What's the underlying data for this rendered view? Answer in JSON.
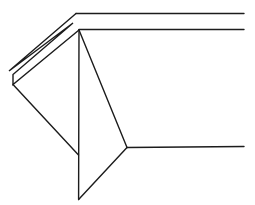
{
  "diagram": {
    "kind": "origami-fold-line-art",
    "background_color": "#ffffff",
    "stroke_color": "#1c1c1c",
    "stroke_width": 1.4,
    "width": 255,
    "height": 205,
    "paths": [
      {
        "name": "top-edge-line",
        "points": [
          [
            76,
            13.5
          ],
          [
            244,
            13.5
          ]
        ]
      },
      {
        "name": "pleat-fold-outline",
        "points": [
          [
            76,
            13.5
          ],
          [
            9,
            71
          ],
          [
            73,
            23
          ],
          [
            13,
            74.5
          ],
          [
            13,
            84.5
          ],
          [
            79,
            30
          ]
        ]
      },
      {
        "name": "upper-horizontal-line",
        "points": [
          [
            79,
            29.5
          ],
          [
            244,
            29.5
          ]
        ]
      },
      {
        "name": "center-vertical-line",
        "points": [
          [
            79,
            30
          ],
          [
            78.6,
            199.5
          ]
        ]
      },
      {
        "name": "triangle-bottom-edge",
        "points": [
          [
            13,
            84.5
          ],
          [
            78.5,
            155
          ]
        ]
      },
      {
        "name": "apex-to-junction-line",
        "points": [
          [
            79,
            30
          ],
          [
            127,
            147.5
          ]
        ]
      },
      {
        "name": "junction-horizontal-line",
        "points": [
          [
            127,
            147.5
          ],
          [
            244,
            146.5
          ]
        ]
      },
      {
        "name": "junction-to-bottom-line",
        "points": [
          [
            127,
            147.5
          ],
          [
            78.6,
            199.5
          ]
        ]
      }
    ]
  }
}
